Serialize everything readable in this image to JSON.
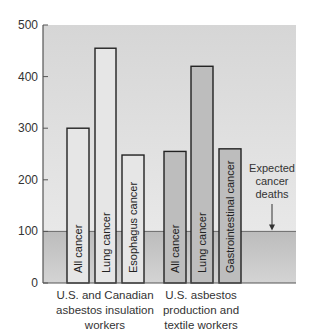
{
  "chart_data": {
    "type": "bar",
    "title": "",
    "xlabel": "",
    "ylabel": "",
    "ylim": [
      0,
      500
    ],
    "yticks": [
      0,
      100,
      200,
      300,
      400,
      500
    ],
    "grid": false,
    "groups": [
      {
        "name": "U.S. and Canadian asbestos insulation workers",
        "label_lines": [
          "U.S. and Canadian",
          "asbestos insulation",
          "workers"
        ],
        "fill": "#e6e6e6",
        "bars": [
          {
            "category": "All cancer",
            "value": 300
          },
          {
            "category": "Lung cancer",
            "value": 455
          },
          {
            "category": "Esophagus cancer",
            "value": 248
          }
        ]
      },
      {
        "name": "U.S. asbestos production and textile workers",
        "label_lines": [
          "U.S. asbestos",
          "production and",
          "textile workers"
        ],
        "fill": "#bdbdbd",
        "bars": [
          {
            "category": "All cancer",
            "value": 255
          },
          {
            "category": "Lung cancer",
            "value": 420
          },
          {
            "category": "Gastrointestinal cancer",
            "value": 260
          }
        ]
      }
    ],
    "reference_line": {
      "value": 100,
      "label": "Expected cancer deaths",
      "label_lines": [
        "Expected",
        "cancer",
        "deaths"
      ]
    },
    "colors": {
      "plot_background": "#dcdcdc",
      "below_expected": "#c4c4c4",
      "bar_outline": "#222222",
      "axis": "#555555"
    }
  },
  "axis": {
    "tick_labels": [
      "0",
      "100",
      "200",
      "300",
      "400",
      "500"
    ]
  }
}
